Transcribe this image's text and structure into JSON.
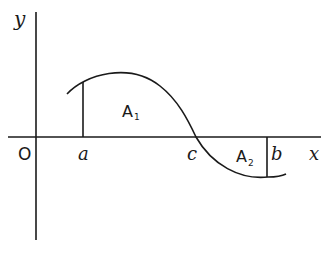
{
  "diagram": {
    "axes": {
      "x_label": "x",
      "y_label": "y",
      "origin_label": "O"
    },
    "points": {
      "a": "a",
      "b": "b",
      "c": "c"
    },
    "regions": [
      {
        "label": "A",
        "subscript": "1",
        "position": "above x-axis between a and c"
      },
      {
        "label": "A",
        "subscript": "2",
        "position": "below x-axis between c and b"
      }
    ],
    "colors": {
      "stroke": "#1a1a1a",
      "background": "#ffffff"
    }
  }
}
